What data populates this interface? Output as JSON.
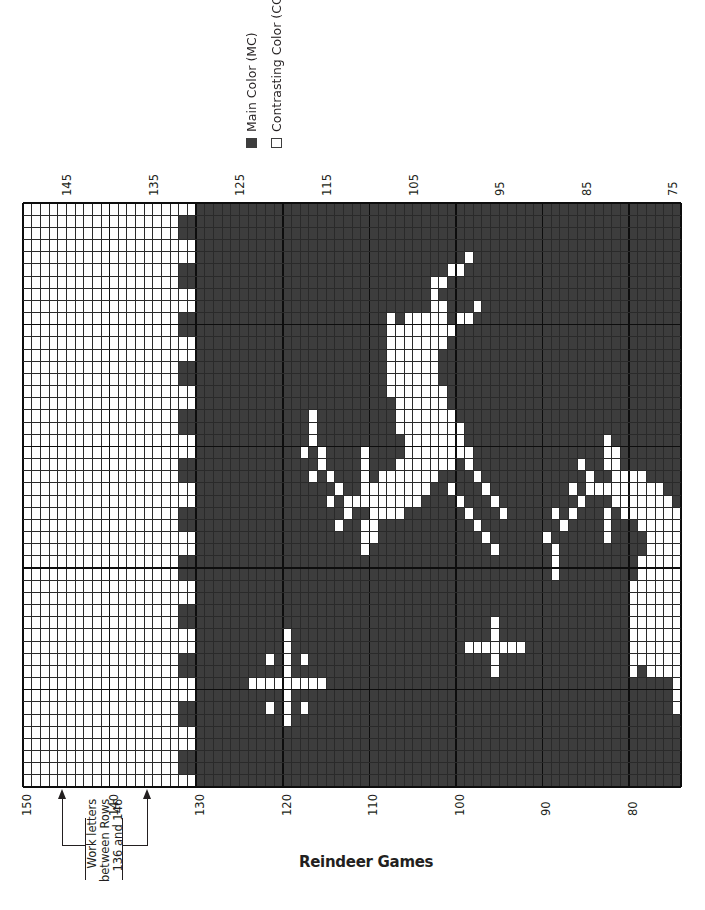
{
  "legend": {
    "items": [
      {
        "label": "Main Color (MC)",
        "swatch": "filled",
        "color": "#3d3d3d"
      },
      {
        "label": "Contrasting Color (CC)",
        "swatch": "outline",
        "color": "#ffffff"
      }
    ]
  },
  "title": "Reindeer Games",
  "annotation": {
    "lines": [
      "Work letters",
      "between Rows",
      "136 and 146"
    ],
    "arrow_rows": [
      146,
      136
    ]
  },
  "colors": {
    "main": "#3d3d3d",
    "contrast": "#ffffff",
    "gridline_dark": "#111111",
    "gridline_light": "#444444"
  },
  "chart_data": {
    "type": "heatmap",
    "title": "Reindeer Games",
    "columns": {
      "start_row": 150,
      "end_row": 75,
      "count": 76
    },
    "stitch_count": 48,
    "top_tick_labels": [
      "145",
      "135",
      "125",
      "115",
      "105",
      "95",
      "85",
      "75"
    ],
    "bottom_tick_labels": [
      "150",
      "140",
      "130",
      "120",
      "110",
      "100",
      "90",
      "80"
    ],
    "legend": [
      "Main Color (MC)",
      "Contrasting Color (CC)"
    ],
    "regions": [
      {
        "name": "letter-area-all-CC",
        "rows": "150-133",
        "color": "CC"
      },
      {
        "name": "checker-border",
        "rows": "132-131",
        "pattern": "2 MC / 2 CC alternating, starts with 1 CC"
      },
      {
        "name": "motif-field",
        "rows": "130-75",
        "background": "MC",
        "motifs": [
          "leaping reindeer",
          "standing reindeer",
          "two stars"
        ]
      }
    ],
    "light_cells": {
      "4": [
        51
      ],
      "5": [
        49,
        50
      ],
      "6": [
        47,
        48
      ],
      "7": [
        47
      ],
      "8": [
        47,
        48,
        52
      ],
      "9": [
        42,
        44,
        45,
        46,
        47,
        48,
        50,
        51
      ],
      "10": [
        42,
        43,
        44,
        45,
        46,
        47,
        48,
        49
      ],
      "11": [
        42,
        43,
        44,
        45,
        46,
        47,
        48
      ],
      "12": [
        42,
        43,
        44,
        45,
        46,
        47
      ],
      "13": [
        42,
        43,
        44,
        45,
        46,
        47
      ],
      "14": [
        42,
        43,
        44,
        45,
        46,
        47
      ],
      "15": [
        42,
        43,
        44,
        45,
        46,
        47,
        48
      ],
      "16": [
        43,
        44,
        45,
        46,
        47,
        48
      ],
      "17": [
        33,
        43,
        44,
        45,
        46,
        47,
        48,
        49
      ],
      "18": [
        33,
        43,
        44,
        45,
        46,
        47,
        48,
        49,
        50
      ],
      "19": [
        33,
        44,
        45,
        46,
        47,
        48,
        49,
        50,
        67
      ],
      "20": [
        32,
        34,
        39,
        44,
        45,
        46,
        47,
        48,
        49,
        50,
        51,
        67,
        68
      ],
      "21": [
        34,
        39,
        43,
        44,
        45,
        46,
        47,
        48,
        49,
        51,
        64,
        67,
        68
      ],
      "22": [
        33,
        35,
        39,
        41,
        42,
        43,
        44,
        45,
        46,
        47,
        52,
        65,
        68,
        69,
        70,
        71
      ],
      "23": [
        36,
        39,
        40,
        41,
        42,
        43,
        44,
        45,
        46,
        49,
        53,
        63,
        65,
        66,
        67,
        68,
        69,
        70,
        71,
        72,
        73
      ],
      "24": [
        35,
        37,
        38,
        39,
        40,
        41,
        42,
        43,
        44,
        45,
        50,
        54,
        64,
        68,
        69,
        70,
        71,
        72,
        73,
        74
      ],
      "25": [
        37,
        40,
        41,
        42,
        43,
        51,
        55,
        61,
        63,
        67,
        69,
        70,
        71,
        72,
        73,
        74,
        75
      ],
      "26": [
        36,
        39,
        40,
        52,
        62,
        67,
        71,
        72,
        73,
        74,
        75
      ],
      "27": [
        39,
        40,
        53,
        60,
        67,
        72,
        73,
        74,
        75
      ],
      "28": [
        39,
        54,
        61,
        72,
        73,
        74,
        75
      ],
      "29": [
        61,
        71,
        72,
        73,
        74,
        75
      ],
      "30": [
        61,
        71,
        72,
        73,
        74,
        75
      ],
      "31": [
        70,
        71,
        72,
        73,
        74,
        75
      ],
      "32": [
        70,
        71,
        72,
        73,
        74,
        75
      ],
      "33": [
        70,
        71,
        72,
        73,
        74,
        75
      ],
      "34": [
        54,
        70,
        71,
        72,
        73,
        74,
        75
      ],
      "35": [
        30,
        54,
        70,
        71,
        72,
        73,
        74,
        75
      ],
      "36": [
        30,
        51,
        52,
        53,
        54,
        55,
        56,
        57,
        70,
        71,
        72,
        73,
        74,
        75
      ],
      "37": [
        28,
        30,
        32,
        54,
        70,
        71,
        72,
        73,
        74,
        75
      ],
      "38": [
        30,
        54,
        70,
        72,
        73,
        74,
        75
      ],
      "39": [
        26,
        27,
        28,
        29,
        30,
        31,
        32,
        33,
        34,
        75
      ],
      "40": [
        30,
        75
      ],
      "41": [
        28,
        30,
        32,
        75
      ],
      "42": [
        30
      ]
    }
  }
}
